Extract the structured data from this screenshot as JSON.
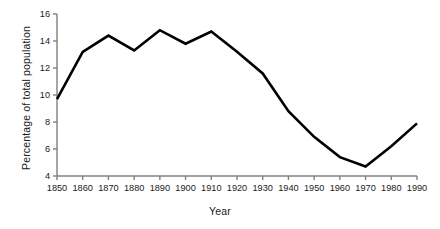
{
  "chart_data": {
    "type": "line",
    "title": "",
    "xlabel": "Year",
    "ylabel": "Percentage of total population",
    "x": [
      1850,
      1860,
      1870,
      1880,
      1890,
      1900,
      1910,
      1920,
      1930,
      1940,
      1950,
      1960,
      1970,
      1980,
      1990
    ],
    "values": [
      9.7,
      13.2,
      14.4,
      13.3,
      14.8,
      13.8,
      14.7,
      13.2,
      11.6,
      8.8,
      6.9,
      5.4,
      4.7,
      6.2,
      7.9
    ],
    "series": [
      {
        "name": "Percentage of total population",
        "values": [
          9.7,
          13.2,
          14.4,
          13.3,
          14.8,
          13.8,
          14.7,
          13.2,
          11.6,
          8.8,
          6.9,
          5.4,
          4.7,
          6.2,
          7.9
        ]
      }
    ],
    "xlim": [
      1850,
      1990
    ],
    "ylim": [
      4,
      16
    ],
    "x_ticks": [
      1850,
      1860,
      1870,
      1880,
      1890,
      1900,
      1910,
      1920,
      1930,
      1940,
      1950,
      1960,
      1970,
      1980,
      1990
    ],
    "x_tick_labels": [
      "1850",
      "1860",
      "1870",
      "1880",
      "1890",
      "1900",
      "1910",
      "1920",
      "1930",
      "1940",
      "1950",
      "1960",
      "1970",
      "1980",
      "1990"
    ],
    "y_ticks": [
      4,
      6,
      8,
      10,
      12,
      14,
      16
    ],
    "y_tick_labels": [
      "4",
      "6",
      "8",
      "10",
      "12",
      "14",
      "16"
    ],
    "grid": false,
    "legend": false,
    "legend_position": "none",
    "line_color": "#000000",
    "axis_color": "#808080",
    "background_color": "#ffffff",
    "annotations": []
  },
  "axes": {
    "x_title": "Year",
    "y_title": "Percentage of total population"
  }
}
